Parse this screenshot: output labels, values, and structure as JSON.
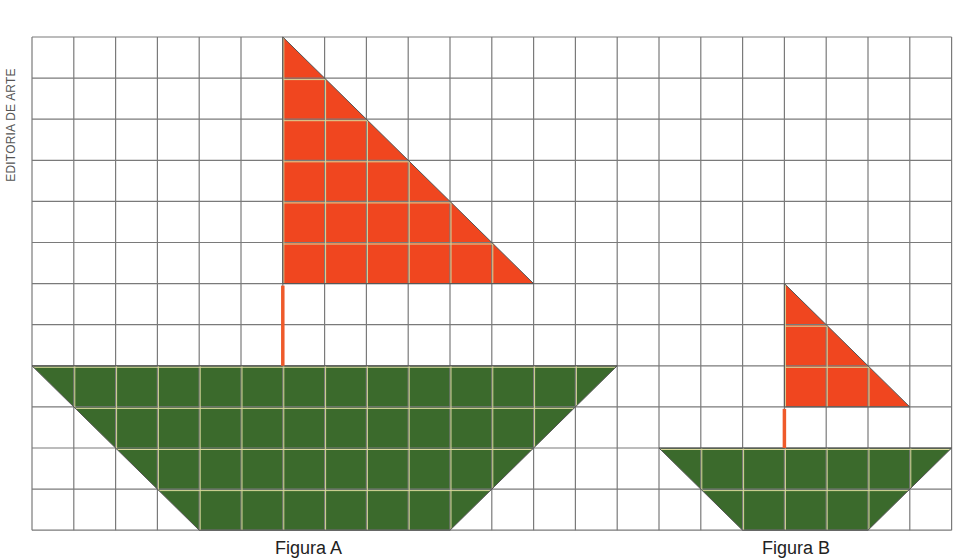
{
  "credit": "EDITORIA DE ARTE",
  "grid": {
    "origin_x": 32,
    "origin_y": 37,
    "cell_w": 41.8,
    "cell_h": 41.1,
    "cols": 22,
    "rows": 12,
    "line_color": "#7a7a7a"
  },
  "colors": {
    "sail": "#f0461f",
    "hull": "#3b6a2c",
    "mast": "#ef5a2a",
    "inner_line": "#d8d89a"
  },
  "figures": [
    {
      "label": "Figura A",
      "sail": [
        [
          6,
          0
        ],
        [
          6,
          6
        ],
        [
          12,
          6
        ]
      ],
      "mast": {
        "col": 6,
        "row_top": 6,
        "row_bottom": 8
      },
      "hull": [
        [
          0,
          8
        ],
        [
          14,
          8
        ],
        [
          10,
          12
        ],
        [
          4,
          12
        ]
      ]
    },
    {
      "label": "Figura B",
      "sail": [
        [
          18,
          6
        ],
        [
          18,
          9
        ],
        [
          21,
          9
        ]
      ],
      "mast": {
        "col": 18,
        "row_top": 9,
        "row_bottom": 10
      },
      "hull": [
        [
          15,
          10
        ],
        [
          22,
          10
        ],
        [
          20,
          12
        ],
        [
          17,
          12
        ]
      ]
    }
  ]
}
